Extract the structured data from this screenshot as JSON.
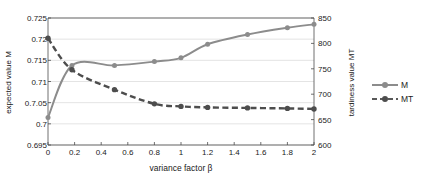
{
  "chart_data": {
    "type": "line",
    "title": "",
    "xlabel": "variance factor β",
    "ylabel": "expected value M",
    "ylabel_secondary": "tardiness value MT",
    "xlim": [
      0,
      2
    ],
    "ylim": [
      0.695,
      0.725
    ],
    "ylim_secondary": [
      600,
      850
    ],
    "grid": true,
    "legend_position": "right",
    "xticks": [
      "0",
      "0.2",
      "0.4",
      "0.6",
      "0.8",
      "1",
      "1.2",
      "1.4",
      "1.6",
      "1.8",
      "2"
    ],
    "xtick_values": [
      0,
      0.2,
      0.4,
      0.6,
      0.8,
      1,
      1.2,
      1.4,
      1.6,
      1.8,
      2
    ],
    "yticks": [
      "0.695",
      "0.7",
      "0.7.05",
      "0.71",
      "0.715",
      "0.72",
      "0.725"
    ],
    "ytick_values": [
      0.695,
      0.7,
      0.705,
      0.71,
      0.715,
      0.72,
      0.725
    ],
    "yticks_secondary": [
      "600",
      "650",
      "700",
      "750",
      "800",
      "850"
    ],
    "ytick_values_secondary": [
      600,
      650,
      700,
      750,
      800,
      850
    ],
    "series": [
      {
        "name": "M",
        "axis": "left",
        "color": "#8c8c8c",
        "style": "solid",
        "marker": "circle",
        "x": [
          0,
          0.18,
          0.5,
          0.8,
          1,
          1.2,
          1.5,
          1.8,
          2
        ],
        "values": [
          0.7015,
          0.7138,
          0.7138,
          0.7147,
          0.7156,
          0.7188,
          0.7211,
          0.7227,
          0.7235
        ]
      },
      {
        "name": "MT",
        "axis": "right",
        "color": "#4d4d4d",
        "style": "dashed",
        "marker": "circle",
        "x": [
          0,
          0.18,
          0.5,
          0.8,
          1,
          1.2,
          1.5,
          1.8,
          2
        ],
        "values": [
          810,
          748,
          709,
          681,
          676,
          674,
          673,
          672,
          671
        ]
      }
    ]
  },
  "legend": {
    "items": [
      {
        "label": "M"
      },
      {
        "label": "MT"
      }
    ]
  },
  "colors": {
    "series_m": "#8c8c8c",
    "series_mt": "#4d4d4d",
    "axis": "#4d4d4d",
    "grid": "#d9d9d9",
    "background": "#ffffff"
  }
}
